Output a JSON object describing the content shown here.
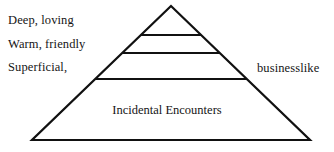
{
  "diagram": {
    "type": "pyramid",
    "title": "",
    "background_color": "#ffffff",
    "line_color": "#111111",
    "text_color": "#151515",
    "apex": {
      "x": 171,
      "y": 6
    },
    "base_left": {
      "x": 32,
      "y": 140
    },
    "base_right": {
      "x": 310,
      "y": 140
    },
    "divider_y": [
      35,
      53,
      79
    ],
    "tiers": [
      {
        "index": 0,
        "name": "apex-tier",
        "inner_label": ""
      },
      {
        "index": 1,
        "name": "second-tier",
        "inner_label": ""
      },
      {
        "index": 2,
        "name": "third-tier",
        "inner_label": ""
      },
      {
        "index": 3,
        "name": "base-tier",
        "inner_label": "Incidental Encounters"
      }
    ],
    "left_labels": [
      {
        "id": "deep-loving",
        "text": "Deep, loving"
      },
      {
        "id": "warm-friendly",
        "text": "Warm, friendly"
      },
      {
        "id": "superficial",
        "text": "Superficial,"
      }
    ],
    "right_labels": [
      {
        "id": "businesslike",
        "text": "businesslike"
      }
    ]
  }
}
